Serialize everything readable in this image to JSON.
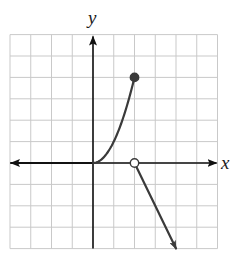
{
  "chart_data": {
    "type": "line",
    "title": "",
    "xlabel": "x",
    "ylabel": "y",
    "xlim": [
      -4,
      6
    ],
    "ylim": [
      -4,
      6
    ],
    "grid": true,
    "grid_step": 1,
    "tick_labels": false,
    "legend": null,
    "series": [
      {
        "name": "piece-1",
        "description": "y = 0 for x <= 0 (arrow to the left)",
        "points": [
          [
            -4,
            0
          ],
          [
            0,
            0
          ]
        ],
        "left_arrow": true
      },
      {
        "name": "piece-2",
        "description": "y = x^2 for 0 <= x <= 2",
        "points": [
          [
            0,
            0
          ],
          [
            0.5,
            0.25
          ],
          [
            1,
            1
          ],
          [
            1.5,
            2.25
          ],
          [
            2,
            4
          ]
        ],
        "endpoint": {
          "x": 2,
          "y": 4,
          "style": "filled"
        }
      },
      {
        "name": "piece-3",
        "description": "y = -2x + 4 for x > 2 (arrow down-right)",
        "points": [
          [
            2,
            0
          ],
          [
            4,
            -4
          ]
        ],
        "startpoint": {
          "x": 2,
          "y": 0,
          "style": "open"
        },
        "right_arrow": true
      }
    ]
  },
  "labels": {
    "x_axis": "x",
    "y_axis": "y"
  },
  "colors": {
    "grid": "#c9c9c9",
    "axis": "#111111",
    "curve": "#3a3a3a"
  }
}
